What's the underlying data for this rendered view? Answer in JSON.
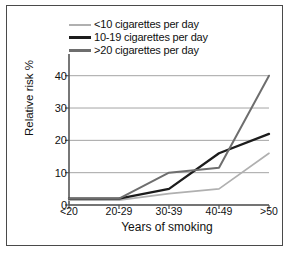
{
  "chart_data": {
    "type": "line",
    "title": "",
    "xlabel": "Years of smoking",
    "ylabel": "Relative risk %",
    "categories": [
      "<20",
      "20-29",
      "30-39",
      "40-49",
      ">50"
    ],
    "yticks": [
      0,
      10,
      20,
      30,
      40
    ],
    "ylim": [
      0,
      43
    ],
    "grid": true,
    "legend_position": "top",
    "series": [
      {
        "name": "<10 cigarettes per day",
        "color": "#b0b0b0",
        "values": [
          1.5,
          1.5,
          3.5,
          5,
          16
        ]
      },
      {
        "name": "10-19 cigarettes per day",
        "color": "#1c1c1c",
        "values": [
          2,
          2,
          5,
          16,
          22
        ]
      },
      {
        "name": ">20 cigarettes per day",
        "color": "#6e6e6e",
        "values": [
          2,
          2,
          10,
          11.5,
          40
        ]
      }
    ]
  },
  "axes": {
    "y_tick_labels": [
      "0",
      "10",
      "20",
      "30",
      "40"
    ],
    "x_tick_labels": [
      "<20",
      "20-29",
      "30-39",
      "40-49",
      ">50"
    ],
    "ylabel": "Relative risk %",
    "xlabel": "Years of smoking"
  },
  "legend": {
    "items": [
      {
        "label": "<10 cigarettes per day",
        "color": "#b0b0b0"
      },
      {
        "label": "10-19 cigarettes per day",
        "color": "#1c1c1c"
      },
      {
        "label": ">20 cigarettes per day",
        "color": "#6e6e6e"
      }
    ]
  },
  "style": {
    "border_color": "#4a4a4a",
    "grid_color": "#9a9a9a",
    "axis_color": "#555555",
    "background": "#ffffff"
  }
}
